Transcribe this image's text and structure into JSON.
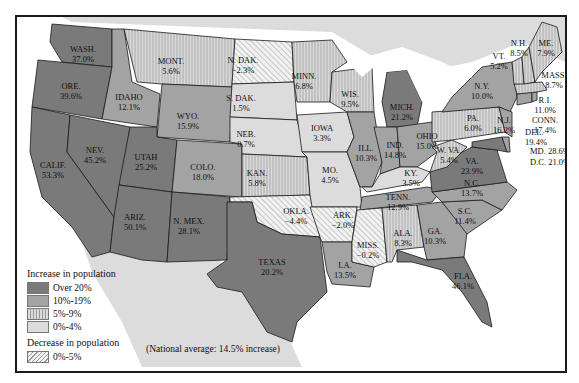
{
  "colors": {
    "over20": "#7a7a7a",
    "p10to19": "#a3a3a3",
    "p5to9": "#cfcfcf",
    "p0to4": "#dcdcdc",
    "decrease": "#ececec",
    "land_other": "#d8d8d8",
    "water": "#ffffff",
    "border": "#1a1a1a"
  },
  "legend": {
    "increase_title": "Increase in population",
    "items": [
      {
        "label": "Over 20%",
        "class": "over20"
      },
      {
        "label": "10%-19%",
        "class": "p10to19"
      },
      {
        "label": "5%-9%",
        "class": "p5to9"
      },
      {
        "label": "0%-4%",
        "class": "p0to4"
      }
    ],
    "decrease_title": "Decrease in population",
    "decrease_items": [
      {
        "label": "0%-5%",
        "class": "decrease"
      }
    ]
  },
  "note": "(National average: 14.5% increase)",
  "states": {
    "wash": {
      "name": "WASH.",
      "value": "37.0%"
    },
    "ore": {
      "name": "ORE.",
      "value": "39.6%"
    },
    "calif": {
      "name": "CALIF.",
      "value": "53.3%"
    },
    "nev": {
      "name": "NEV.",
      "value": "45.2%"
    },
    "idaho": {
      "name": "IDAHO",
      "value": "12.1%"
    },
    "mont": {
      "name": "MONT.",
      "value": "5.6%"
    },
    "wyo": {
      "name": "WYO.",
      "value": "15.9%"
    },
    "utah": {
      "name": "UTAH",
      "value": "25.2%"
    },
    "colo": {
      "name": "COLO.",
      "value": "18.0%"
    },
    "ariz": {
      "name": "ARIZ.",
      "value": "50.1%"
    },
    "nmex": {
      "name": "N. MEX.",
      "value": "28.1%"
    },
    "ndak": {
      "name": "N. DAK.",
      "value": "−2.3%"
    },
    "sdak": {
      "name": "S. DAK.",
      "value": "1.5%"
    },
    "neb": {
      "name": "NEB.",
      "value": "0.7%"
    },
    "kan": {
      "name": "KAN.",
      "value": "5.8%"
    },
    "okla": {
      "name": "OKLA.",
      "value": "−4.4%"
    },
    "texas": {
      "name": "TEXAS",
      "value": "20.2%"
    },
    "minn": {
      "name": "MINN.",
      "value": "6.8%"
    },
    "iowa": {
      "name": "IOWA",
      "value": "3.3%"
    },
    "mo": {
      "name": "MO.",
      "value": "4.5%"
    },
    "ark": {
      "name": "ARK.",
      "value": "−2.0%"
    },
    "la": {
      "name": "LA.",
      "value": "13.5%"
    },
    "wis": {
      "name": "WIS.",
      "value": "9.5%"
    },
    "ill": {
      "name": "ILL.",
      "value": "10.3%"
    },
    "mich": {
      "name": "MICH.",
      "value": "21.2%"
    },
    "ind": {
      "name": "IND.",
      "value": "14.8%"
    },
    "ohio": {
      "name": "OHIO",
      "value": "15.0%"
    },
    "ky": {
      "name": "KY.",
      "value": "3.5%"
    },
    "tenn": {
      "name": "TENN.",
      "value": "12.9%"
    },
    "miss": {
      "name": "MISS.",
      "value": "−0.2%"
    },
    "ala": {
      "name": "ALA.",
      "value": "8.3%"
    },
    "ga": {
      "name": "GA.",
      "value": "10.3%"
    },
    "fla": {
      "name": "FLA.",
      "value": "46.1%"
    },
    "sc": {
      "name": "S.C.",
      "value": "11.4%"
    },
    "nc": {
      "name": "N.C.",
      "value": "13.7%"
    },
    "va": {
      "name": "VA.",
      "value": "23.9%"
    },
    "wva": {
      "name": "W. VA.",
      "value": "5.4%"
    },
    "pa": {
      "name": "PA.",
      "value": "6.0%"
    },
    "ny": {
      "name": "N.Y.",
      "value": "10.0%"
    },
    "nj": {
      "name": "N.J.",
      "value": "16.2%"
    },
    "del": {
      "name": "DEL.",
      "value": "19.4%"
    },
    "md": {
      "name": "MD.",
      "value": "28.6%"
    },
    "dc": {
      "name": "D.C.",
      "value": "21.0%"
    },
    "conn": {
      "name": "CONN.",
      "value": "17.4%"
    },
    "ri": {
      "name": "R.I.",
      "value": "11.0%"
    },
    "mass": {
      "name": "MASS.",
      "value": "8.7%"
    },
    "vt": {
      "name": "VT.",
      "value": "5.2%"
    },
    "nh": {
      "name": "N.H.",
      "value": "8.5%"
    },
    "me": {
      "name": "ME.",
      "value": "7.9%"
    }
  }
}
